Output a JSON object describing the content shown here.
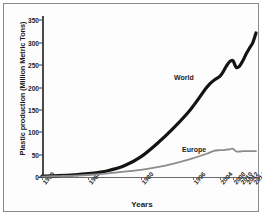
{
  "chart_data": {
    "type": "line",
    "title": "",
    "xlabel": "Years",
    "ylabel": "Plastic production (Million Metric Tons)",
    "ylim": [
      0,
      360
    ],
    "xlim": [
      1950,
      2015
    ],
    "grid": false,
    "legend_position": "inline-annotation",
    "yticks": [
      0,
      50,
      100,
      150,
      200,
      250,
      300,
      350
    ],
    "ytick_labels": [
      "0",
      "50",
      "100",
      "150",
      "200",
      "250",
      "300",
      "350"
    ],
    "xticks": [
      1950,
      1964,
      1980,
      1996,
      2004,
      2008,
      2010,
      2012,
      2014
    ],
    "xtick_labels": [
      "1950",
      "1964",
      "1980",
      "1996",
      "2004",
      "2008",
      "2010",
      "2012",
      "2014"
    ],
    "x": [
      1950,
      1955,
      1960,
      1965,
      1970,
      1975,
      1980,
      1985,
      1990,
      1995,
      2000,
      2002,
      2004,
      2005,
      2006,
      2007,
      2008,
      2009,
      2010,
      2011,
      2012,
      2013,
      2014,
      2015
    ],
    "series": [
      {
        "name": "World",
        "color": "#141414",
        "width": 3.2,
        "values": [
          2,
          3,
          5,
          8,
          14,
          25,
          45,
          75,
          110,
          150,
          200,
          215,
          225,
          235,
          248,
          258,
          260,
          245,
          248,
          260,
          275,
          288,
          300,
          322
        ]
      },
      {
        "name": "Europe",
        "color": "#8c8c8c",
        "width": 1.8,
        "values": [
          1,
          2,
          3,
          5,
          8,
          12,
          16,
          22,
          30,
          40,
          52,
          58,
          60,
          60,
          61,
          62,
          63,
          57,
          57,
          58,
          58,
          58,
          58,
          58
        ]
      }
    ],
    "annotations": [
      {
        "text": "World",
        "x": 2011,
        "y": 255
      },
      {
        "text": "Europe",
        "x": 2011,
        "y": 40
      }
    ]
  },
  "axis": {
    "y_title": "Plastic production (Million Metric Tons)",
    "x_title": "Years"
  },
  "labels": {
    "world": "World",
    "europe": "Europe"
  }
}
